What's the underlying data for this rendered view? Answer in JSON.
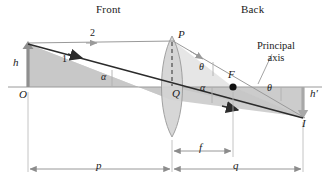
{
  "figure": {
    "type": "optics-ray-diagram",
    "colors": {
      "fill_gray": "#c9c9c9",
      "fill_gray_light": "#d6d6d6",
      "ray_dark": "#2b2b2b",
      "ray_light": "#9a9a9a",
      "axis": "#9a9a9a",
      "dimension": "#8c8c8c",
      "text": "#1a1a1a",
      "lens_fill": "#d2d2d2",
      "focal_dot": "#111111"
    }
  },
  "headings": {
    "front": "Front",
    "back": "Back"
  },
  "annotations": {
    "principal_axis_line1": "Principal",
    "principal_axis_line2": "axis"
  },
  "points": {
    "object_base": "O",
    "lens_top": "P",
    "lens_center": "Q",
    "focal_point": "F",
    "image_tip": "I"
  },
  "rays": {
    "ray_one": "1",
    "ray_two": "2"
  },
  "angles": {
    "alpha_left": "α",
    "alpha_right": "α",
    "theta_lens": "θ",
    "theta_axis": "θ"
  },
  "heights": {
    "object_height": "h",
    "image_height": "h′"
  },
  "dimensions": {
    "object_distance": "p",
    "focal_length": "f",
    "image_distance": "q"
  },
  "geometry": {
    "axis_y": 87,
    "object_x": 28,
    "object_top_y": 43,
    "lens_x": 172,
    "lens_top_y": 36,
    "lens_bottom_y": 137,
    "focal_x": 233,
    "image_x": 303,
    "image_bottom_y": 118,
    "dim_f_start_x": 172,
    "dim_f_end_x": 233,
    "dim_p_start_x": 28,
    "dim_p_end_x": 172,
    "dim_q_start_x": 172,
    "dim_q_end_x": 303
  }
}
